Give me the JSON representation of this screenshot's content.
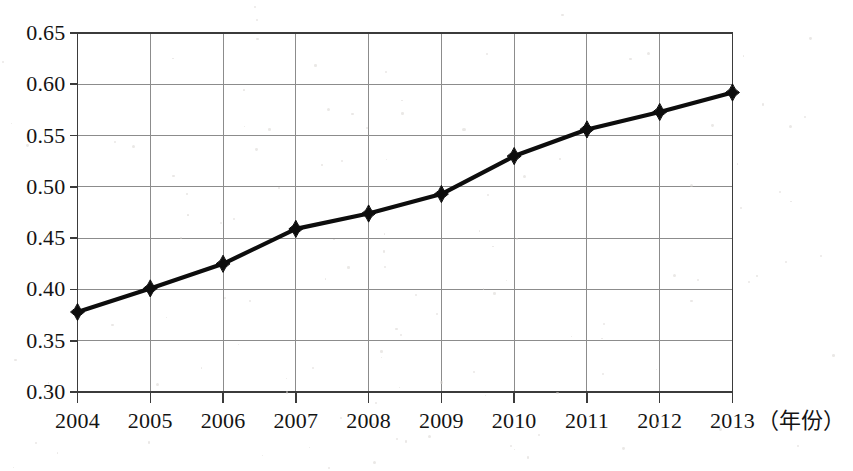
{
  "chart_data": {
    "type": "line",
    "title": "",
    "subtitle": "",
    "xlabel": "（年份）",
    "ylabel": "",
    "categories": [
      "2004",
      "2005",
      "2006",
      "2007",
      "2008",
      "2009",
      "2010",
      "2011",
      "2012",
      "2013"
    ],
    "x": [
      2004,
      2005,
      2006,
      2007,
      2008,
      2009,
      2010,
      2011,
      2012,
      2013
    ],
    "values": [
      0.378,
      0.401,
      0.425,
      0.459,
      0.474,
      0.493,
      0.53,
      0.556,
      0.573,
      0.592
    ],
    "series": [
      {
        "name": "",
        "values": [
          0.378,
          0.401,
          0.425,
          0.459,
          0.474,
          0.493,
          0.53,
          0.556,
          0.573,
          0.592
        ]
      }
    ],
    "ylim": [
      0.3,
      0.65
    ],
    "xlim": [
      2004,
      2013
    ],
    "ytick_labels": [
      "0.65",
      "0.60",
      "0.55",
      "0.50",
      "0.45",
      "0.40",
      "0.35",
      "0.30"
    ],
    "ytick_values": [
      0.65,
      0.6,
      0.55,
      0.5,
      0.45,
      0.4,
      0.35,
      0.3
    ],
    "xtick_labels": [
      "2004",
      "2005",
      "2006",
      "2007",
      "2008",
      "2009",
      "2010",
      "2011",
      "2012",
      "2013"
    ],
    "grid": true,
    "grid_x": true,
    "grid_y": true,
    "legend": false,
    "legend_position": "none",
    "marker": "diamond",
    "line_color": "#0d0d0d",
    "marker_color": "#0d0d0d",
    "grid_color": "#8c8c8c",
    "axis_color": "#3b3b3b",
    "background_color": "#ffffff",
    "annotations": []
  },
  "axis_unit": {
    "text": "（年份）"
  }
}
